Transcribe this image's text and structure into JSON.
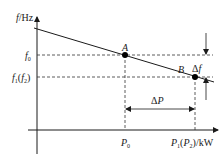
{
  "diagram": {
    "type": "frequency-power droop characteristic",
    "axes": {
      "y_label_italic": "f",
      "y_label_unit": "/Hz",
      "x_label_p": "P",
      "x_label_sub1": "1",
      "x_label_paren_open": "(",
      "x_label_p2": "P",
      "x_label_sub2": "2",
      "x_label_unit": ")/kW"
    },
    "y_ticks": {
      "f0_main": "f",
      "f0_sub": "0",
      "f1_main": "f",
      "f1_sub": "1",
      "f1_paren_open": "(",
      "f2_main": "f",
      "f2_sub": "2",
      "f1_paren_close": ")"
    },
    "x_ticks": {
      "p0_main": "P",
      "p0_sub": "0"
    },
    "points": [
      {
        "label": "A",
        "x_ref": "P0",
        "y_ref": "f0"
      },
      {
        "label": "B",
        "x_ref": "P1(P2)",
        "y_ref": "f1(f2)"
      }
    ],
    "annotations": {
      "delta_p": "ΔP",
      "delta_f": "Δf",
      "delta_symbol": "Δ",
      "delta_p_letter": "P",
      "delta_f_letter": "f"
    },
    "colors": {
      "line": "#1a1a1a",
      "dashed": "#333333",
      "point": "#000000"
    }
  }
}
